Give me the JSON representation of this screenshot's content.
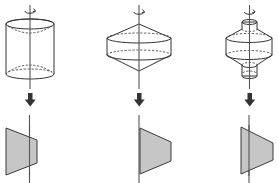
{
  "diagram": {
    "figures": [
      {
        "solid": "cylinder with inner conical hollows",
        "cross_section": "trapezoid crossing the axis"
      },
      {
        "solid": "double cone joined by a cylinder band",
        "cross_section": "trapezoid touching the axis"
      },
      {
        "solid": "double cone band with small cylinders at top and bottom",
        "cross_section": "trapezoid crossing the axis"
      }
    ],
    "icons": [
      "rotation-arrow-icon",
      "down-arrow-icon"
    ],
    "colors": {
      "solid_fill_light": "#f2f2f2",
      "solid_fill_dark": "#cfcfcf",
      "section_fill": "#c6c6c6",
      "line": "#333333"
    }
  }
}
